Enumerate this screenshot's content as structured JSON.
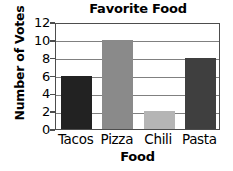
{
  "chart_data": {
    "type": "bar",
    "title": "Favorite Food",
    "xlabel": "Food",
    "ylabel": "Number of Votes",
    "categories": [
      "Tacos",
      "Pizza",
      "Chili",
      "Pasta"
    ],
    "values": [
      6,
      10,
      2,
      8
    ],
    "ylim": [
      0,
      12
    ],
    "ytick_labels": [
      "0",
      "2",
      "4",
      "6",
      "8",
      "10",
      "12"
    ],
    "ytick_values": [
      0,
      2,
      4,
      6,
      8,
      10,
      12
    ],
    "grid": true,
    "legend": false,
    "bar_colors": [
      "#222222",
      "#8a8a8a",
      "#b5b5b5",
      "#3f3f3f"
    ],
    "axis_color": "#4d4d4d",
    "grid_color": "#808080",
    "background": "#ffffff"
  }
}
